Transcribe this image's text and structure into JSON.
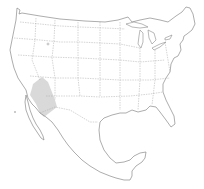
{
  "map": {
    "region": "United States and Mexico",
    "highlighted_region": "Sonoran Desert",
    "colors": {
      "background": "#ffffff",
      "outline": "#8a8a8a",
      "highlight": "#d9d9d9"
    }
  }
}
